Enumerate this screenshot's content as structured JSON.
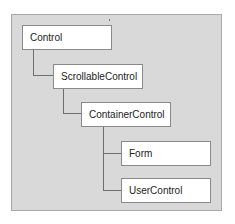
{
  "diagram": {
    "type": "class-hierarchy",
    "nodes": [
      {
        "id": "control",
        "label": "Control",
        "parent": null
      },
      {
        "id": "scrollable",
        "label": "ScrollableControl",
        "parent": "control"
      },
      {
        "id": "container",
        "label": "ContainerControl",
        "parent": "scrollable"
      },
      {
        "id": "form",
        "label": "Form",
        "parent": "container"
      },
      {
        "id": "usercontrol",
        "label": "UserControl",
        "parent": "container"
      }
    ],
    "colors": {
      "background": "#d9d9d9",
      "node_fill": "#ffffff",
      "connector": "#6e6e6e"
    }
  }
}
